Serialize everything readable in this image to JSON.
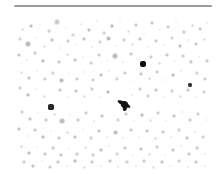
{
  "figure": {
    "kind": "astronomical-plate-image",
    "title": "Star field photographic plate",
    "width_px": 219,
    "height_px": 174,
    "background_color": "#ffffff"
  },
  "top_rule": {
    "name": "horizontal-rule",
    "x": 14,
    "y": 5,
    "width": 198,
    "height": 2,
    "color": "#9a9a9a"
  },
  "plate": {
    "name": "star-field-plate",
    "x": 17,
    "y": 16,
    "width": 195,
    "height": 154,
    "background_color": "#ffffff",
    "note": "dense scattering of gray point sources, one dark compact source and one dark elongated streak"
  },
  "features": {
    "dark_point_source": {
      "label": "bright-star",
      "cx": 143,
      "cy": 64,
      "r": 3.2,
      "color": "#101010"
    },
    "dark_streak": {
      "label": "elongated-object",
      "cx": 124,
      "cy": 104,
      "length": 14,
      "width": 4,
      "angle_deg": -62,
      "color": "#121212"
    },
    "secondary_dark_point": {
      "label": "secondary-star",
      "cx": 51,
      "cy": 107,
      "r": 2.6,
      "color": "#2a2a2a"
    },
    "tertiary_dark_point": {
      "label": "tertiary-star",
      "cx": 190,
      "cy": 85,
      "r": 2.2,
      "color": "#333333"
    }
  },
  "chart_data": {
    "type": "scatter",
    "title": "Star field photographic plate",
    "xlabel": "",
    "ylabel": "",
    "xlim": [
      17,
      212
    ],
    "ylim": [
      16,
      170
    ],
    "grid": false,
    "legend": null,
    "note": "Grayscale point sources; value = darkness/opacity (0-1), size = apparent radius in px",
    "columns": [
      "x",
      "y",
      "r",
      "alpha"
    ],
    "points": [
      [
        22,
        29,
        1.5,
        0.18
      ],
      [
        31,
        26,
        2.2,
        0.3
      ],
      [
        40,
        24,
        1.2,
        0.14
      ],
      [
        49,
        31,
        1.6,
        0.22
      ],
      [
        57,
        22,
        2.6,
        0.26
      ],
      [
        66,
        28,
        1.1,
        0.12
      ],
      [
        73,
        35,
        1.8,
        0.2
      ],
      [
        81,
        24,
        1.4,
        0.16
      ],
      [
        89,
        30,
        2.0,
        0.28
      ],
      [
        97,
        21,
        1.3,
        0.15
      ],
      [
        104,
        33,
        1.7,
        0.22
      ],
      [
        112,
        26,
        2.4,
        0.32
      ],
      [
        120,
        22,
        1.2,
        0.13
      ],
      [
        128,
        31,
        1.5,
        0.18
      ],
      [
        136,
        25,
        1.9,
        0.24
      ],
      [
        144,
        34,
        1.3,
        0.16
      ],
      [
        152,
        23,
        2.1,
        0.26
      ],
      [
        160,
        30,
        1.4,
        0.17
      ],
      [
        168,
        27,
        1.7,
        0.21
      ],
      [
        176,
        22,
        1.2,
        0.14
      ],
      [
        184,
        32,
        1.8,
        0.23
      ],
      [
        192,
        25,
        1.5,
        0.19
      ],
      [
        200,
        29,
        2.0,
        0.25
      ],
      [
        207,
        23,
        1.3,
        0.15
      ],
      [
        20,
        39,
        1.6,
        0.2
      ],
      [
        28,
        44,
        2.8,
        0.34
      ],
      [
        36,
        38,
        1.2,
        0.13
      ],
      [
        44,
        46,
        1.5,
        0.19
      ],
      [
        52,
        40,
        2.2,
        0.28
      ],
      [
        60,
        48,
        1.3,
        0.15
      ],
      [
        68,
        41,
        1.8,
        0.23
      ],
      [
        76,
        45,
        1.1,
        0.12
      ],
      [
        84,
        39,
        2.0,
        0.26
      ],
      [
        92,
        47,
        1.4,
        0.17
      ],
      [
        100,
        42,
        1.6,
        0.21
      ],
      [
        108,
        38,
        2.5,
        0.33
      ],
      [
        116,
        46,
        1.2,
        0.14
      ],
      [
        124,
        40,
        1.7,
        0.22
      ],
      [
        132,
        44,
        1.5,
        0.18
      ],
      [
        140,
        39,
        2.1,
        0.27
      ],
      [
        148,
        47,
        1.3,
        0.16
      ],
      [
        156,
        41,
        1.9,
        0.24
      ],
      [
        164,
        45,
        1.2,
        0.13
      ],
      [
        172,
        38,
        1.6,
        0.2
      ],
      [
        180,
        46,
        2.3,
        0.29
      ],
      [
        188,
        40,
        1.4,
        0.17
      ],
      [
        196,
        44,
        1.8,
        0.23
      ],
      [
        204,
        39,
        1.5,
        0.19
      ],
      [
        19,
        55,
        2.0,
        0.25
      ],
      [
        27,
        60,
        1.3,
        0.15
      ],
      [
        35,
        53,
        1.7,
        0.22
      ],
      [
        43,
        61,
        2.4,
        0.31
      ],
      [
        51,
        56,
        1.2,
        0.13
      ],
      [
        59,
        62,
        1.8,
        0.23
      ],
      [
        67,
        54,
        1.5,
        0.19
      ],
      [
        75,
        60,
        2.2,
        0.28
      ],
      [
        83,
        57,
        1.1,
        0.12
      ],
      [
        91,
        63,
        1.6,
        0.21
      ],
      [
        99,
        55,
        1.9,
        0.24
      ],
      [
        107,
        61,
        1.3,
        0.16
      ],
      [
        115,
        56,
        2.6,
        0.34
      ],
      [
        123,
        62,
        1.4,
        0.17
      ],
      [
        131,
        54,
        1.7,
        0.22
      ],
      [
        139,
        60,
        1.2,
        0.14
      ],
      [
        143,
        64,
        3.2,
        0.95
      ],
      [
        151,
        57,
        1.8,
        0.23
      ],
      [
        159,
        63,
        1.5,
        0.19
      ],
      [
        167,
        55,
        2.0,
        0.26
      ],
      [
        175,
        61,
        1.3,
        0.15
      ],
      [
        183,
        56,
        1.6,
        0.21
      ],
      [
        191,
        62,
        1.9,
        0.25
      ],
      [
        199,
        57,
        1.4,
        0.17
      ],
      [
        207,
        61,
        1.7,
        0.22
      ],
      [
        21,
        72,
        1.5,
        0.19
      ],
      [
        29,
        78,
        2.1,
        0.27
      ],
      [
        37,
        71,
        1.2,
        0.13
      ],
      [
        45,
        79,
        1.8,
        0.23
      ],
      [
        53,
        73,
        1.6,
        0.21
      ],
      [
        61,
        80,
        2.5,
        0.32
      ],
      [
        69,
        74,
        1.1,
        0.12
      ],
      [
        77,
        79,
        1.9,
        0.24
      ],
      [
        85,
        72,
        1.4,
        0.17
      ],
      [
        93,
        80,
        1.7,
        0.22
      ],
      [
        101,
        75,
        2.2,
        0.29
      ],
      [
        109,
        71,
        1.3,
        0.15
      ],
      [
        117,
        79,
        1.6,
        0.2
      ],
      [
        125,
        73,
        1.8,
        0.23
      ],
      [
        133,
        80,
        1.2,
        0.14
      ],
      [
        141,
        74,
        2.0,
        0.26
      ],
      [
        149,
        78,
        1.5,
        0.19
      ],
      [
        157,
        72,
        1.7,
        0.22
      ],
      [
        165,
        80,
        1.3,
        0.16
      ],
      [
        173,
        75,
        2.3,
        0.3
      ],
      [
        181,
        71,
        1.4,
        0.17
      ],
      [
        190,
        85,
        2.2,
        0.62
      ],
      [
        197,
        73,
        1.6,
        0.21
      ],
      [
        205,
        79,
        1.9,
        0.24
      ],
      [
        20,
        88,
        1.7,
        0.22
      ],
      [
        28,
        95,
        2.3,
        0.3
      ],
      [
        36,
        89,
        1.2,
        0.13
      ],
      [
        44,
        96,
        1.5,
        0.19
      ],
      [
        51,
        107,
        2.6,
        0.78
      ],
      [
        60,
        90,
        1.8,
        0.23
      ],
      [
        68,
        97,
        1.3,
        0.16
      ],
      [
        76,
        91,
        2.1,
        0.27
      ],
      [
        84,
        96,
        1.5,
        0.19
      ],
      [
        92,
        89,
        1.7,
        0.22
      ],
      [
        100,
        97,
        1.2,
        0.14
      ],
      [
        108,
        92,
        2.4,
        0.31
      ],
      [
        124,
        104,
        3.5,
        0.92
      ],
      [
        132,
        95,
        1.4,
        0.17
      ],
      [
        140,
        89,
        1.8,
        0.23
      ],
      [
        148,
        96,
        1.6,
        0.21
      ],
      [
        156,
        90,
        2.0,
        0.26
      ],
      [
        164,
        97,
        1.3,
        0.15
      ],
      [
        172,
        91,
        1.7,
        0.22
      ],
      [
        180,
        96,
        1.5,
        0.19
      ],
      [
        188,
        90,
        1.9,
        0.25
      ],
      [
        196,
        97,
        1.2,
        0.14
      ],
      [
        204,
        92,
        1.6,
        0.2
      ],
      [
        22,
        112,
        1.6,
        0.21
      ],
      [
        30,
        119,
        2.2,
        0.28
      ],
      [
        38,
        113,
        1.2,
        0.14
      ],
      [
        46,
        120,
        1.8,
        0.23
      ],
      [
        54,
        114,
        1.5,
        0.19
      ],
      [
        62,
        121,
        2.6,
        0.33
      ],
      [
        70,
        115,
        1.3,
        0.16
      ],
      [
        78,
        120,
        1.9,
        0.24
      ],
      [
        86,
        113,
        1.7,
        0.22
      ],
      [
        94,
        121,
        1.4,
        0.17
      ],
      [
        102,
        116,
        2.1,
        0.27
      ],
      [
        110,
        112,
        1.2,
        0.13
      ],
      [
        118,
        120,
        1.6,
        0.2
      ],
      [
        126,
        114,
        1.8,
        0.23
      ],
      [
        134,
        121,
        1.3,
        0.15
      ],
      [
        142,
        115,
        2.3,
        0.3
      ],
      [
        150,
        120,
        1.5,
        0.19
      ],
      [
        158,
        113,
        1.7,
        0.22
      ],
      [
        166,
        121,
        1.2,
        0.14
      ],
      [
        174,
        116,
        2.0,
        0.26
      ],
      [
        182,
        112,
        1.4,
        0.17
      ],
      [
        190,
        120,
        1.8,
        0.23
      ],
      [
        198,
        114,
        1.6,
        0.21
      ],
      [
        206,
        120,
        1.3,
        0.15
      ],
      [
        19,
        129,
        2.0,
        0.26
      ],
      [
        27,
        136,
        1.4,
        0.17
      ],
      [
        35,
        130,
        1.7,
        0.22
      ],
      [
        43,
        137,
        2.4,
        0.31
      ],
      [
        51,
        131,
        1.2,
        0.14
      ],
      [
        59,
        138,
        1.8,
        0.23
      ],
      [
        67,
        132,
        1.5,
        0.19
      ],
      [
        75,
        137,
        2.2,
        0.28
      ],
      [
        83,
        130,
        1.1,
        0.12
      ],
      [
        91,
        138,
        1.6,
        0.21
      ],
      [
        99,
        131,
        1.9,
        0.25
      ],
      [
        107,
        137,
        1.3,
        0.16
      ],
      [
        115,
        132,
        2.5,
        0.32
      ],
      [
        123,
        138,
        1.4,
        0.17
      ],
      [
        131,
        130,
        1.7,
        0.22
      ],
      [
        139,
        137,
        1.2,
        0.14
      ],
      [
        147,
        131,
        2.0,
        0.26
      ],
      [
        155,
        138,
        1.5,
        0.19
      ],
      [
        163,
        132,
        1.8,
        0.23
      ],
      [
        171,
        137,
        1.3,
        0.16
      ],
      [
        179,
        130,
        1.6,
        0.21
      ],
      [
        187,
        138,
        2.1,
        0.27
      ],
      [
        195,
        132,
        1.4,
        0.17
      ],
      [
        203,
        137,
        1.7,
        0.22
      ],
      [
        21,
        146,
        1.5,
        0.19
      ],
      [
        29,
        153,
        2.3,
        0.3
      ],
      [
        37,
        147,
        1.2,
        0.13
      ],
      [
        45,
        154,
        1.8,
        0.23
      ],
      [
        53,
        148,
        1.6,
        0.21
      ],
      [
        61,
        155,
        2.0,
        0.26
      ],
      [
        69,
        149,
        1.3,
        0.16
      ],
      [
        77,
        154,
        1.9,
        0.24
      ],
      [
        85,
        147,
        1.5,
        0.19
      ],
      [
        93,
        155,
        1.7,
        0.22
      ],
      [
        101,
        150,
        2.2,
        0.29
      ],
      [
        109,
        146,
        1.2,
        0.14
      ],
      [
        117,
        154,
        1.6,
        0.2
      ],
      [
        125,
        148,
        1.8,
        0.23
      ],
      [
        133,
        155,
        1.3,
        0.15
      ],
      [
        141,
        149,
        2.1,
        0.27
      ],
      [
        149,
        154,
        1.5,
        0.19
      ],
      [
        157,
        147,
        1.7,
        0.22
      ],
      [
        165,
        155,
        1.2,
        0.14
      ],
      [
        173,
        150,
        2.0,
        0.26
      ],
      [
        181,
        146,
        1.4,
        0.17
      ],
      [
        189,
        154,
        1.8,
        0.23
      ],
      [
        197,
        148,
        1.6,
        0.21
      ],
      [
        205,
        154,
        1.3,
        0.15
      ],
      [
        24,
        162,
        1.7,
        0.22
      ],
      [
        33,
        166,
        2.1,
        0.27
      ],
      [
        42,
        161,
        1.3,
        0.15
      ],
      [
        50,
        167,
        1.6,
        0.21
      ],
      [
        58,
        162,
        1.9,
        0.24
      ],
      [
        67,
        166,
        1.2,
        0.14
      ],
      [
        75,
        161,
        2.4,
        0.31
      ],
      [
        84,
        167,
        1.5,
        0.19
      ],
      [
        92,
        162,
        1.7,
        0.22
      ],
      [
        101,
        166,
        1.3,
        0.16
      ],
      [
        110,
        161,
        2.0,
        0.26
      ],
      [
        118,
        167,
        1.4,
        0.17
      ],
      [
        127,
        162,
        1.6,
        0.21
      ],
      [
        136,
        166,
        1.2,
        0.14
      ],
      [
        144,
        161,
        1.8,
        0.23
      ],
      [
        153,
        167,
        1.5,
        0.19
      ],
      [
        162,
        162,
        2.2,
        0.28
      ],
      [
        170,
        166,
        1.3,
        0.15
      ],
      [
        179,
        161,
        1.7,
        0.22
      ],
      [
        188,
        167,
        1.4,
        0.17
      ],
      [
        196,
        162,
        1.9,
        0.24
      ],
      [
        205,
        166,
        1.2,
        0.14
      ]
    ]
  }
}
